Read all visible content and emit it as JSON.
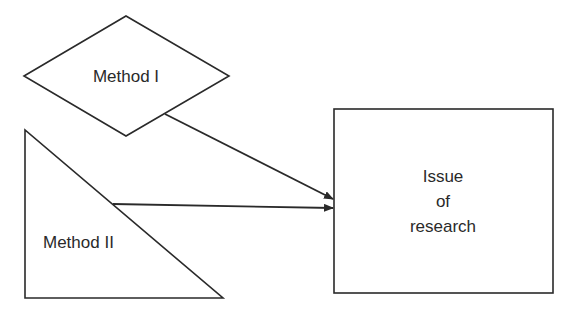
{
  "diagram": {
    "nodes": [
      {
        "id": "method1",
        "shape": "diamond",
        "label": "Method I"
      },
      {
        "id": "method2",
        "shape": "right-triangle",
        "label": "Method II"
      },
      {
        "id": "issue",
        "shape": "rectangle",
        "label_lines": [
          "Issue",
          "of",
          "research"
        ]
      }
    ],
    "edges": [
      {
        "from": "method1",
        "to": "issue"
      },
      {
        "from": "method2",
        "to": "issue"
      }
    ],
    "colors": {
      "stroke": "#2a2a2a",
      "background": "#ffffff"
    }
  }
}
